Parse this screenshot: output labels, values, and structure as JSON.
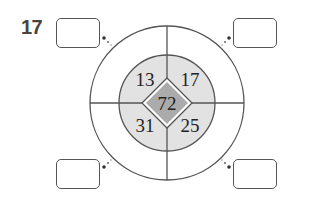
{
  "problem": {
    "number": "17"
  },
  "diagram": {
    "center_value": "72",
    "quadrant_values": {
      "top_left": "13",
      "top_right": "17",
      "bottom_left": "31",
      "bottom_right": "25"
    },
    "answer_boxes": [
      {
        "position": "top-left",
        "value": ""
      },
      {
        "position": "top-right",
        "value": ""
      },
      {
        "position": "bottom-left",
        "value": ""
      },
      {
        "position": "bottom-right",
        "value": ""
      }
    ],
    "colors": {
      "inner_ring_fill": "#e2e2e2",
      "diamond_fill": "#ababab",
      "line": "#555555"
    }
  }
}
